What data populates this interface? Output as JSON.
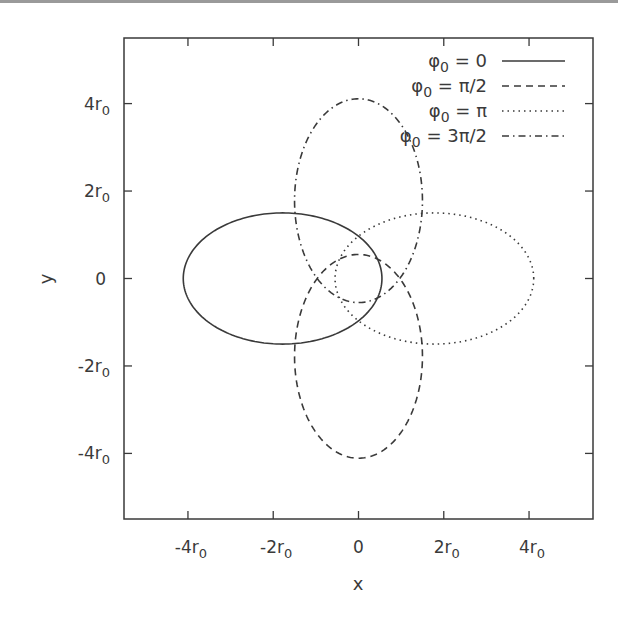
{
  "chart_data": {
    "type": "line",
    "title": "",
    "xlabel": "x",
    "ylabel": "y",
    "xlim": [
      -5.5,
      5.5
    ],
    "ylim": [
      -5.5,
      5.5
    ],
    "grid": false,
    "legend_position": "top-right",
    "x_ticks": [
      {
        "value": -4,
        "base": "-4r",
        "sub": "0"
      },
      {
        "value": -2,
        "base": "-2r",
        "sub": "0"
      },
      {
        "value": 0,
        "base": "0",
        "sub": ""
      },
      {
        "value": 2,
        "base": "2r",
        "sub": "0"
      },
      {
        "value": 4,
        "base": "4r",
        "sub": "0"
      }
    ],
    "y_ticks": [
      {
        "value": 4,
        "base": "4r",
        "sub": "0"
      },
      {
        "value": 2,
        "base": "2r",
        "sub": "0"
      },
      {
        "value": 0,
        "base": "0",
        "sub": ""
      },
      {
        "value": -2,
        "base": "-2r",
        "sub": "0"
      },
      {
        "value": -4,
        "base": "-4r",
        "sub": "0"
      }
    ],
    "units": "r0",
    "series": [
      {
        "name": "φ0 = 0",
        "label_base": "φ",
        "label_sub": "0",
        "label_rest": " = 0",
        "phi0": 0,
        "style": "solid",
        "center": [
          -1.78,
          0
        ],
        "semi_major": 2.33,
        "semi_minor": 1.5,
        "orientation_deg": 0
      },
      {
        "name": "φ0 = π/2",
        "label_base": "φ",
        "label_sub": "0",
        "label_rest": " = π/2",
        "phi0": 1.5708,
        "style": "dashed",
        "center": [
          0,
          -1.78
        ],
        "semi_major": 2.33,
        "semi_minor": 1.5,
        "orientation_deg": 90
      },
      {
        "name": "φ0 = π",
        "label_base": "φ",
        "label_sub": "0",
        "label_rest": " = π",
        "phi0": 3.1416,
        "style": "dotted",
        "center": [
          1.78,
          0
        ],
        "semi_major": 2.33,
        "semi_minor": 1.5,
        "orientation_deg": 0
      },
      {
        "name": "φ0 = 3π/2",
        "label_base": "φ",
        "label_sub": "0",
        "label_rest": " = 3π/2",
        "phi0": 4.7124,
        "style": "dashdot",
        "center": [
          0,
          1.78
        ],
        "semi_major": 2.33,
        "semi_minor": 1.5,
        "orientation_deg": 90
      }
    ],
    "colors": {
      "line": "#3a3a3a",
      "frame": "#3a3a3a",
      "text": "#3a3a3a",
      "topbar": "#9a9a9a"
    }
  }
}
